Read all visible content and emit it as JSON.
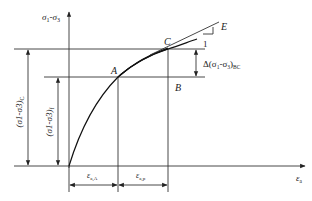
{
  "diagram": {
    "type": "stress-strain curve",
    "axes": {
      "y_label": "σ1-σ3",
      "x_label": "εa"
    },
    "points": [
      {
        "id": "A",
        "label": "A"
      },
      {
        "id": "B",
        "label": "B"
      },
      {
        "id": "C",
        "label": "C"
      },
      {
        "id": "E",
        "label": "E"
      }
    ],
    "slope_label": "1",
    "dimensions": {
      "stress_C": "(σ1-σ3)C",
      "stress_f": "(σ1-σ3)f",
      "delta_BC": "Δ(σ1-σ3)BC",
      "strain_A": "εa,A",
      "strain_p": "εa,p"
    }
  },
  "labels": {
    "y_axis_main": "σ",
    "y_axis_sub1": "1",
    "y_axis_dash": "-σ",
    "y_axis_sub3": "3",
    "x_axis_main": "ε",
    "x_axis_sub": "a",
    "point_A": "A",
    "point_B": "B",
    "point_C": "C",
    "point_E": "E",
    "slope_one": "1",
    "delta_prefix": "Δ(σ",
    "delta_sub1": "1",
    "delta_mid": "-σ",
    "delta_sub3": "3",
    "delta_close": ")",
    "delta_subBC": "BC",
    "stressC_text": "(σ1-σ3)",
    "stressC_sub": "C",
    "stressf_text": "(σ1-σ3)",
    "stressf_sub": "f",
    "strainA_main": "ε",
    "strainA_sub": "a,A",
    "strainp_main": "ε",
    "strainp_sub": "a,p"
  }
}
